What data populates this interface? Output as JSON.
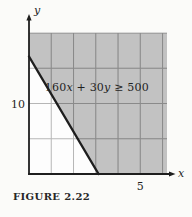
{
  "figure": {
    "caption": "FIGURE 2.22"
  },
  "colors": {
    "background": "#fbfbf9",
    "plot_background": "#fdfdfd",
    "shade": "#c2c2c2",
    "grid_light": "#b6b6b6",
    "grid_dark": "#8a8a8a",
    "line": "#1e1e1e",
    "text": "#1f1f1f"
  },
  "chart_data": {
    "type": "area",
    "title": "",
    "inequality_label": "160x + 30y ≥ 500",
    "label_segments": [
      {
        "text": "160",
        "italic": false
      },
      {
        "text": "x",
        "italic": true
      },
      {
        "text": " + 30",
        "italic": false
      },
      {
        "text": "y",
        "italic": true
      },
      {
        "text": " ≥ 500",
        "italic": false
      }
    ],
    "annotation_position": {
      "x": 3.05,
      "y": 12.3
    },
    "boundary_line": {
      "equation": "160x + 30y = 500",
      "x_intercept": 3.125,
      "y_intercept": 16.667
    },
    "shaded_side": "above",
    "xlabel": "x",
    "ylabel": "y",
    "xlim": [
      0,
      6.2
    ],
    "ylim": [
      0,
      20
    ],
    "x_grid_step": 1,
    "y_grid_step": 5,
    "x_ticks": [
      {
        "value": 5,
        "label": "5"
      }
    ],
    "y_ticks": [
      {
        "value": 10,
        "label": "10"
      }
    ],
    "grid": true,
    "legend": false
  }
}
